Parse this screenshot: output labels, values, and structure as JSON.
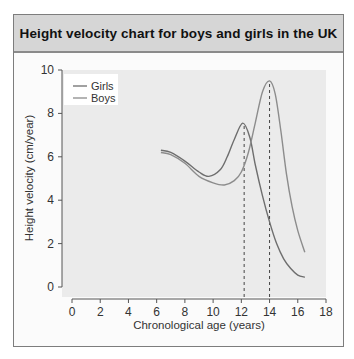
{
  "header": {
    "title": "Height velocity chart for boys and girls in the UK"
  },
  "colors": {
    "girls": "#6e6e6e",
    "boys": "#8c8c8c",
    "plot_bg": "#ebebeb",
    "header_bg": "#d6d6d6"
  },
  "chart_data": {
    "type": "line",
    "title": "Height velocity chart for boys and girls in the UK",
    "xlabel": "Chronological age (years)",
    "ylabel": "Height velocity (cm/year)",
    "xlim": [
      0,
      18
    ],
    "ylim": [
      0,
      10
    ],
    "xticks": [
      0,
      2,
      4,
      6,
      8,
      10,
      12,
      14,
      16,
      18
    ],
    "yticks": [
      0,
      2,
      4,
      6,
      8,
      10
    ],
    "grid": false,
    "legend": {
      "position": "upper left",
      "entries": [
        "Girls",
        "Boys"
      ]
    },
    "series": [
      {
        "name": "Girls",
        "x": [
          6.3,
          7,
          8,
          9,
          9.7,
          10.5,
          11,
          11.5,
          12.1,
          12.6,
          13,
          13.5,
          14,
          14.5,
          15,
          15.5,
          16,
          16.5
        ],
        "y": [
          6.3,
          6.2,
          5.8,
          5.3,
          5.1,
          5.4,
          6.0,
          6.8,
          7.55,
          6.9,
          5.6,
          4.2,
          3.0,
          2.0,
          1.3,
          0.85,
          0.55,
          0.45
        ]
      },
      {
        "name": "Boys",
        "x": [
          6.3,
          7,
          8,
          9,
          10,
          10.8,
          11.5,
          12,
          12.5,
          13,
          13.5,
          14,
          14.4,
          14.8,
          15.2,
          15.6,
          16,
          16.5
        ],
        "y": [
          6.2,
          6.1,
          5.7,
          5.1,
          4.8,
          4.7,
          4.9,
          5.3,
          6.2,
          7.6,
          9.0,
          9.5,
          8.9,
          7.2,
          5.2,
          3.7,
          2.6,
          1.6
        ]
      }
    ],
    "annotations": [
      {
        "type": "vline",
        "x": 12.2,
        "style": "dashed",
        "label": "Girls peak"
      },
      {
        "type": "vline",
        "x": 14.0,
        "style": "dashed",
        "label": "Boys peak"
      }
    ]
  }
}
